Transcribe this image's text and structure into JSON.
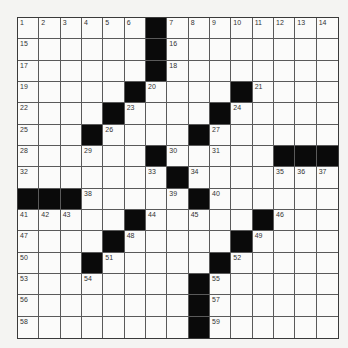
{
  "puzzle": {
    "rows": 15,
    "cols": 15,
    "colors": {
      "background": "#f4f4f2",
      "cell": "#fbfbfa",
      "block": "#0a0a0a",
      "grid_line": "#5a5a5a"
    },
    "grid": [
      [
        1,
        2,
        3,
        4,
        5,
        6,
        "#",
        7,
        8,
        9,
        10,
        11,
        12,
        13,
        14
      ],
      [
        15,
        0,
        0,
        0,
        0,
        0,
        "#",
        16,
        0,
        0,
        0,
        0,
        0,
        0,
        0
      ],
      [
        17,
        0,
        0,
        0,
        0,
        0,
        "#",
        18,
        0,
        0,
        0,
        0,
        0,
        0,
        0
      ],
      [
        19,
        0,
        0,
        0,
        0,
        "#",
        20,
        0,
        0,
        0,
        "#",
        21,
        0,
        0,
        0
      ],
      [
        22,
        0,
        0,
        0,
        "#",
        23,
        0,
        0,
        0,
        "#",
        24,
        0,
        0,
        0,
        0
      ],
      [
        25,
        0,
        0,
        "#",
        26,
        0,
        0,
        0,
        "#",
        27,
        0,
        0,
        0,
        0,
        0
      ],
      [
        28,
        0,
        0,
        29,
        0,
        0,
        "#",
        30,
        0,
        31,
        0,
        0,
        "#",
        "#",
        "#"
      ],
      [
        32,
        0,
        0,
        0,
        0,
        0,
        33,
        "#",
        34,
        0,
        0,
        0,
        35,
        36,
        37
      ],
      [
        "#",
        "#",
        "#",
        38,
        0,
        0,
        0,
        39,
        "#",
        40,
        0,
        0,
        0,
        0,
        0
      ],
      [
        41,
        42,
        43,
        0,
        0,
        "#",
        44,
        0,
        45,
        0,
        0,
        "#",
        46,
        0,
        0
      ],
      [
        47,
        0,
        0,
        0,
        "#",
        48,
        0,
        0,
        0,
        0,
        "#",
        49,
        0,
        0,
        0
      ],
      [
        50,
        0,
        0,
        "#",
        51,
        0,
        0,
        0,
        0,
        "#",
        52,
        0,
        0,
        0,
        0
      ],
      [
        53,
        0,
        0,
        54,
        0,
        0,
        0,
        0,
        "#",
        55,
        0,
        0,
        0,
        0,
        0
      ],
      [
        56,
        0,
        0,
        0,
        0,
        0,
        0,
        0,
        "#",
        57,
        0,
        0,
        0,
        0,
        0
      ],
      [
        58,
        0,
        0,
        0,
        0,
        0,
        0,
        0,
        "#",
        59,
        0,
        0,
        0,
        0,
        0
      ]
    ]
  }
}
